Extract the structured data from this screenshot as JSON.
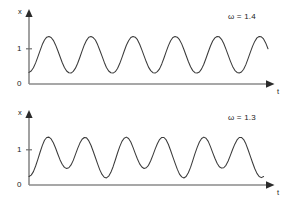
{
  "figure": {
    "type": "line-plot-pair",
    "background": "#ffffff",
    "curve_color": "#3a3a3a",
    "axis_color": "#8a8a8a"
  },
  "panels": [
    {
      "id": "panel-top",
      "parameter_label": "ω = 1.4",
      "y_axis_label": "x",
      "x_axis_label": "t",
      "y_ticks": [
        "1",
        "0"
      ]
    },
    {
      "id": "panel-bottom",
      "parameter_label": "ω = 1.3",
      "y_axis_label": "x",
      "x_axis_label": "t",
      "y_ticks": [
        "1",
        "0"
      ]
    }
  ],
  "chart_data": [
    {
      "type": "line",
      "title": "",
      "subtitle": "",
      "annotations": [
        "ω = 1.4"
      ],
      "xlabel": "t",
      "ylabel": "x",
      "grid": false,
      "legend": "none",
      "xlim": [
        0,
        27
      ],
      "ylim": [
        0,
        1.55
      ],
      "y_tick_values": [
        0,
        1
      ],
      "y_tick_labels": [
        "0",
        "1"
      ],
      "x_tick_values": [],
      "x_tick_labels": [],
      "series": [
        {
          "name": "x(t), omega = 1.4",
          "description": "Regular periodic oscillation, about 6 full cycles, peaks near 1.35 and troughs near 0.30, starting at x=0.33 rising",
          "x": [
            0.0,
            0.25,
            0.5,
            0.75,
            1.0,
            1.25,
            1.5,
            1.75,
            2.0,
            2.25,
            2.5,
            2.75,
            3.0,
            3.25,
            3.5,
            3.75,
            4.0,
            4.25,
            4.5,
            4.75,
            5.0,
            5.25,
            5.5,
            5.75,
            6.0,
            6.25,
            6.5,
            6.75,
            7.0,
            7.25,
            7.5,
            7.75,
            8.0,
            8.25,
            8.5,
            8.75,
            9.0,
            9.25,
            9.5,
            9.75,
            10.0,
            10.25,
            10.5,
            10.75,
            11.0,
            11.25,
            11.5,
            11.75,
            12.0,
            12.25,
            12.5,
            12.75,
            13.0,
            13.25,
            13.5,
            13.75,
            14.0,
            14.25,
            14.5,
            14.75,
            15.0,
            15.25,
            15.5,
            15.75,
            16.0,
            16.25,
            16.5,
            16.75,
            17.0,
            17.25,
            17.5,
            17.75,
            18.0,
            18.25,
            18.5,
            18.75,
            19.0,
            19.25,
            19.5,
            19.75,
            20.0,
            20.25,
            20.5,
            20.75,
            21.0,
            21.25,
            21.5,
            21.75,
            22.0,
            22.25,
            22.5,
            22.75,
            23.0,
            23.25,
            23.5,
            23.75,
            24.0,
            24.25,
            24.5,
            24.75,
            25.0,
            25.25,
            25.5,
            25.75,
            26.0,
            26.25,
            26.5,
            26.75,
            27.0
          ],
          "y": [
            0.33,
            0.37,
            0.46,
            0.6,
            0.77,
            0.95,
            1.12,
            1.25,
            1.33,
            1.35,
            1.32,
            1.24,
            1.11,
            0.95,
            0.78,
            0.61,
            0.47,
            0.37,
            0.32,
            0.31,
            0.36,
            0.45,
            0.59,
            0.76,
            0.94,
            1.11,
            1.24,
            1.33,
            1.35,
            1.32,
            1.25,
            1.12,
            0.96,
            0.79,
            0.62,
            0.47,
            0.37,
            0.32,
            0.31,
            0.35,
            0.44,
            0.58,
            0.75,
            0.93,
            1.1,
            1.23,
            1.32,
            1.35,
            1.33,
            1.26,
            1.13,
            0.97,
            0.8,
            0.63,
            0.48,
            0.38,
            0.32,
            0.31,
            0.35,
            0.43,
            0.57,
            0.74,
            0.92,
            1.09,
            1.23,
            1.32,
            1.35,
            1.33,
            1.26,
            1.14,
            0.98,
            0.81,
            0.64,
            0.49,
            0.38,
            0.32,
            0.31,
            0.34,
            0.43,
            0.56,
            0.73,
            0.91,
            1.08,
            1.22,
            1.31,
            1.35,
            1.34,
            1.27,
            1.15,
            0.99,
            0.82,
            0.65,
            0.5,
            0.39,
            0.33,
            0.31,
            0.34,
            0.42,
            0.55,
            0.72,
            0.9,
            1.07,
            1.21,
            1.31,
            1.35,
            1.34,
            1.28,
            1.16,
            1.0
          ]
        }
      ]
    },
    {
      "type": "line",
      "title": "",
      "subtitle": "",
      "annotations": [
        "ω = 1.3"
      ],
      "xlabel": "t",
      "ylabel": "x",
      "grid": false,
      "legend": "none",
      "xlim": [
        0,
        27
      ],
      "ylim": [
        0,
        1.55
      ],
      "y_tick_values": [
        0,
        1
      ],
      "y_tick_labels": [
        "0",
        "1"
      ],
      "x_tick_values": [],
      "x_tick_labels": [],
      "series": [
        {
          "name": "x(t), omega = 1.3",
          "description": "Quasi-periodic beating oscillation, about 6 peaks near 1.35 with alternating deep (~0.20) and shallow (~0.47) minima",
          "x": [
            0.0,
            0.25,
            0.5,
            0.75,
            1.0,
            1.25,
            1.5,
            1.75,
            2.0,
            2.25,
            2.5,
            2.75,
            3.0,
            3.25,
            3.5,
            3.75,
            4.0,
            4.25,
            4.5,
            4.75,
            5.0,
            5.25,
            5.5,
            5.75,
            6.0,
            6.25,
            6.5,
            6.75,
            7.0,
            7.25,
            7.5,
            7.75,
            8.0,
            8.25,
            8.5,
            8.75,
            9.0,
            9.25,
            9.5,
            9.75,
            10.0,
            10.25,
            10.5,
            10.75,
            11.0,
            11.25,
            11.5,
            11.75,
            12.0,
            12.25,
            12.5,
            12.75,
            13.0,
            13.25,
            13.5,
            13.75,
            14.0,
            14.25,
            14.5,
            14.75,
            15.0,
            15.25,
            15.5,
            15.75,
            16.0,
            16.25,
            16.5,
            16.75,
            17.0,
            17.25,
            17.5,
            17.75,
            18.0,
            18.25,
            18.5,
            18.75,
            19.0,
            19.25,
            19.5,
            19.75,
            20.0,
            20.25,
            20.5,
            20.75,
            21.0,
            21.25,
            21.5,
            21.75,
            22.0,
            22.25,
            22.5,
            22.75,
            23.0,
            23.25,
            23.5,
            23.75,
            24.0,
            24.25,
            24.5,
            24.75,
            25.0,
            25.25,
            25.5,
            25.75,
            26.0,
            26.25,
            26.5,
            26.75,
            27.0
          ],
          "y": [
            0.24,
            0.28,
            0.38,
            0.54,
            0.73,
            0.93,
            1.12,
            1.27,
            1.35,
            1.36,
            1.31,
            1.2,
            1.05,
            0.88,
            0.72,
            0.59,
            0.5,
            0.47,
            0.49,
            0.57,
            0.7,
            0.87,
            1.04,
            1.19,
            1.3,
            1.35,
            1.34,
            1.26,
            1.13,
            0.96,
            0.78,
            0.6,
            0.43,
            0.3,
            0.22,
            0.2,
            0.25,
            0.36,
            0.52,
            0.71,
            0.91,
            1.09,
            1.24,
            1.33,
            1.36,
            1.32,
            1.22,
            1.07,
            0.9,
            0.74,
            0.6,
            0.51,
            0.47,
            0.49,
            0.56,
            0.69,
            0.85,
            1.02,
            1.17,
            1.29,
            1.35,
            1.35,
            1.28,
            1.15,
            0.98,
            0.8,
            0.62,
            0.45,
            0.31,
            0.23,
            0.2,
            0.24,
            0.35,
            0.5,
            0.69,
            0.89,
            1.07,
            1.22,
            1.32,
            1.36,
            1.33,
            1.24,
            1.09,
            0.92,
            0.76,
            0.62,
            0.52,
            0.48,
            0.49,
            0.56,
            0.68,
            0.84,
            1.01,
            1.16,
            1.28,
            1.35,
            1.35,
            1.29,
            1.17,
            1.0,
            0.82,
            0.64,
            0.47,
            0.33,
            0.24,
            0.21,
            0.24
          ]
        }
      ]
    }
  ]
}
